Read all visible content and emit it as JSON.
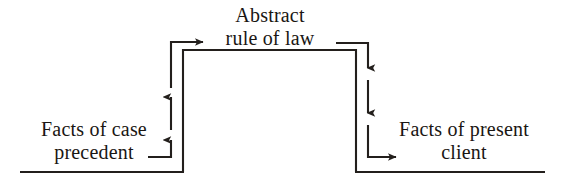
{
  "diagram": {
    "stroke_color": "#231f1c",
    "background_color": "#ffffff",
    "nodes": [
      {
        "id": "abstract-rule",
        "line1": "Abstract",
        "line2": "rule of law",
        "position": "top-center"
      },
      {
        "id": "facts-precedent",
        "line1": "Facts of case",
        "line2": "precedent",
        "position": "bottom-left"
      },
      {
        "id": "facts-client",
        "line1": "Facts of present",
        "line2": "client",
        "position": "bottom-right"
      }
    ],
    "edges": [
      {
        "id": "precedent-to-rule",
        "from": "facts-precedent",
        "to": "abstract-rule",
        "direction": "up-then-right",
        "arrowhead": "right"
      },
      {
        "id": "precedent-riser",
        "from": "facts-precedent",
        "to": "abstract-rule",
        "direction": "up",
        "arrowhead": "up"
      },
      {
        "id": "rule-to-client",
        "from": "abstract-rule",
        "to": "facts-client",
        "direction": "right-then-down",
        "arrowhead": "down"
      },
      {
        "id": "client-descender",
        "from": "abstract-rule",
        "to": "facts-client",
        "direction": "down",
        "arrowhead": "down"
      },
      {
        "id": "client-entry",
        "from": "client-descender",
        "to": "facts-client",
        "direction": "down-then-right",
        "arrowhead": "right"
      }
    ]
  }
}
